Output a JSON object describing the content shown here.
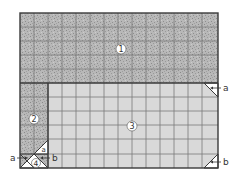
{
  "diagram": {
    "regions": [
      {
        "id": "1",
        "label": "1",
        "fill": "speckled-dark"
      },
      {
        "id": "2",
        "label": "2",
        "fill": "speckled-dark"
      },
      {
        "id": "3",
        "label": "3",
        "fill": "light-grey"
      },
      {
        "id": "4",
        "label": "4",
        "fill": "white"
      }
    ],
    "corner_labels": {
      "top_right_a": "a",
      "bottom_right_b": "b",
      "bottom_left_a_outer": "a",
      "bottom_left_a_inner": "a",
      "bottom_left_b": "b"
    },
    "colors": {
      "speckled_base": "#b4b4b4",
      "speckled_dot": "#8c8c8c",
      "light_fill": "#d9d9d9",
      "grid_line": "#7a7a7a",
      "border": "#3a3a3a",
      "text": "#333333"
    }
  }
}
